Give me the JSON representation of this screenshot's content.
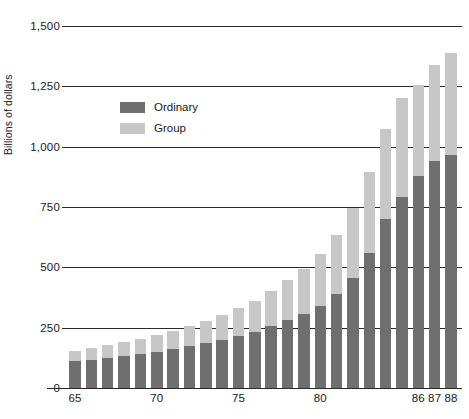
{
  "chart_data": {
    "type": "bar",
    "stacked": true,
    "title": "",
    "xlabel": "",
    "ylabel": "Billions of dollars",
    "ylim": [
      0,
      1500
    ],
    "yticks": [
      "0",
      "250",
      "500",
      "750",
      "1,000",
      "1,250",
      "1,500"
    ],
    "ytick_values": [
      0,
      250,
      500,
      750,
      1000,
      1250,
      1500
    ],
    "grid": true,
    "legend_position": "upper-left-inside",
    "categories": [
      "65",
      "66",
      "67",
      "68",
      "69",
      "70",
      "71",
      "72",
      "73",
      "74",
      "75",
      "76",
      "77",
      "78",
      "79",
      "80",
      "81",
      "82",
      "83",
      "84",
      "85",
      "86",
      "87",
      "88"
    ],
    "xtick_labels": [
      "65",
      "70",
      "75",
      "80",
      "86",
      "87",
      "88"
    ],
    "xtick_categories": [
      "65",
      "70",
      "75",
      "80",
      "86",
      "87",
      "88"
    ],
    "series": [
      {
        "name": "Ordinary",
        "color": "#6f6f6f",
        "values": [
          110,
          118,
          126,
          134,
          142,
          150,
          160,
          172,
          185,
          200,
          216,
          234,
          255,
          280,
          305,
          340,
          390,
          455,
          560,
          700,
          790,
          880,
          940,
          965
        ]
      },
      {
        "name": "Group",
        "color": "#c7c7c7",
        "values": [
          45,
          48,
          52,
          58,
          62,
          68,
          75,
          83,
          92,
          102,
          114,
          128,
          145,
          168,
          190,
          215,
          245,
          290,
          335,
          375,
          410,
          375,
          400,
          425
        ]
      }
    ],
    "totals": [
      155,
      166,
      178,
      192,
      204,
      218,
      235,
      255,
      277,
      302,
      330,
      362,
      400,
      448,
      495,
      555,
      635,
      745,
      895,
      1075,
      1200,
      1255,
      1340,
      1390
    ]
  },
  "legend": {
    "items": [
      {
        "label": "Ordinary",
        "color": "#6f6f6f"
      },
      {
        "label": "Group",
        "color": "#c7c7c7"
      }
    ]
  }
}
